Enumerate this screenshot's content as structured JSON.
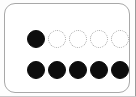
{
  "canvas": {
    "width": 136,
    "height": 97,
    "background_color": "#fdfdfd"
  },
  "card": {
    "name": "dot-indicator-card",
    "background_color": "#ffffff",
    "border_color": "#a8a8a8",
    "corner_radius_px": 11
  },
  "colors": {
    "filled_dot": "#0d0d0d",
    "empty_dot_outline": "#a5a5a5",
    "edge_rule_right": "#9b9b9b",
    "edge_rule_bottom": "#c9c9c9"
  },
  "rows": [
    {
      "name": "progress-row",
      "label": "",
      "total": 5,
      "filled": 1,
      "dots": [
        "filled",
        "empty",
        "empty",
        "empty",
        "empty"
      ],
      "value_text": "1 of 5"
    },
    {
      "name": "complete-row",
      "label": "",
      "total": 5,
      "filled": 5,
      "dots": [
        "filled",
        "filled",
        "filled",
        "filled",
        "filled"
      ],
      "value_text": "5 of 5"
    }
  ]
}
